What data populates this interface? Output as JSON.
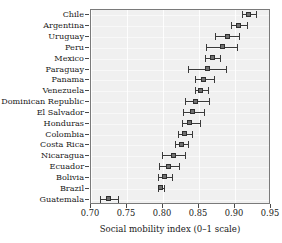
{
  "chart_data": {
    "type": "scatter",
    "title": "",
    "xlabel": "Social mobility index (0–1 scale)",
    "ylabel": "",
    "xlim": [
      0.7,
      0.95
    ],
    "xticks": [
      "0.70",
      "0.75",
      "0.80",
      "0.85",
      "0.90",
      "0.95"
    ],
    "xtick_values": [
      0.7,
      0.75,
      0.8,
      0.85,
      0.9,
      0.95
    ],
    "grid": true,
    "legend": "none",
    "error_bars": "horizontal confidence intervals",
    "categories": [
      "Chile",
      "Argentina",
      "Uruguay",
      "Peru",
      "Mexico",
      "Paraguay",
      "Panama",
      "Venezuela",
      "Dominican Republic",
      "El Salvador",
      "Honduras",
      "Colombia",
      "Costa Rica",
      "Nicaragua",
      "Ecuador",
      "Bolivia",
      "Brazil",
      "Guatemala"
    ],
    "points": [
      {
        "label": "Chile",
        "value": 0.919,
        "low": 0.91,
        "high": 0.929
      },
      {
        "label": "Argentina",
        "value": 0.905,
        "low": 0.894,
        "high": 0.916
      },
      {
        "label": "Uruguay",
        "value": 0.89,
        "low": 0.872,
        "high": 0.905
      },
      {
        "label": "Peru",
        "value": 0.883,
        "low": 0.86,
        "high": 0.903
      },
      {
        "label": "Mexico",
        "value": 0.869,
        "low": 0.858,
        "high": 0.879
      },
      {
        "label": "Paraguay",
        "value": 0.862,
        "low": 0.835,
        "high": 0.888
      },
      {
        "label": "Panama",
        "value": 0.857,
        "low": 0.844,
        "high": 0.871
      },
      {
        "label": "Venezuela",
        "value": 0.853,
        "low": 0.844,
        "high": 0.862
      },
      {
        "label": "Dominican Republic",
        "value": 0.846,
        "low": 0.83,
        "high": 0.864
      },
      {
        "label": "El Salvador",
        "value": 0.842,
        "low": 0.828,
        "high": 0.857
      },
      {
        "label": "Honduras",
        "value": 0.838,
        "low": 0.826,
        "high": 0.851
      },
      {
        "label": "Colombia",
        "value": 0.831,
        "low": 0.821,
        "high": 0.84
      },
      {
        "label": "Costa Rica",
        "value": 0.826,
        "low": 0.817,
        "high": 0.835
      },
      {
        "label": "Nicaragua",
        "value": 0.815,
        "low": 0.799,
        "high": 0.831
      },
      {
        "label": "Ecuador",
        "value": 0.808,
        "low": 0.794,
        "high": 0.822
      },
      {
        "label": "Bolivia",
        "value": 0.803,
        "low": 0.793,
        "high": 0.812
      },
      {
        "label": "Brazil",
        "value": 0.797,
        "low": 0.793,
        "high": 0.801
      },
      {
        "label": "Guatemala",
        "value": 0.725,
        "low": 0.712,
        "high": 0.738
      }
    ]
  }
}
